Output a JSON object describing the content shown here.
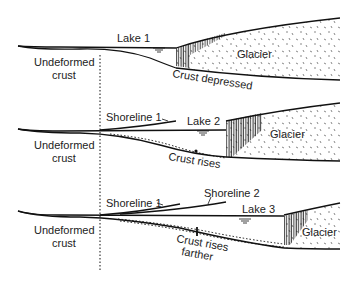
{
  "diagram": {
    "panels": [
      {
        "lake_label": "Lake 1",
        "glacier_label": "Glacier",
        "crust_left_label": [
          "Undeformed",
          "crust"
        ],
        "crust_right_label": "Crust depressed"
      },
      {
        "shoreline_labels": [
          "Shoreline 1"
        ],
        "lake_label": "Lake 2",
        "glacier_label": "Glacier",
        "crust_left_label": [
          "Undeformed",
          "crust"
        ],
        "crust_right_label": "Crust rises"
      },
      {
        "shoreline_labels": [
          "Shoreline 1",
          "Shoreline 2"
        ],
        "lake_label": "Lake 3",
        "glacier_label": "Glacier",
        "crust_left_label": [
          "Undeformed",
          "crust"
        ],
        "crust_right_label": [
          "Crust rises",
          "farther"
        ]
      }
    ],
    "colors": {
      "line": "#111111",
      "background": "#ffffff"
    }
  }
}
